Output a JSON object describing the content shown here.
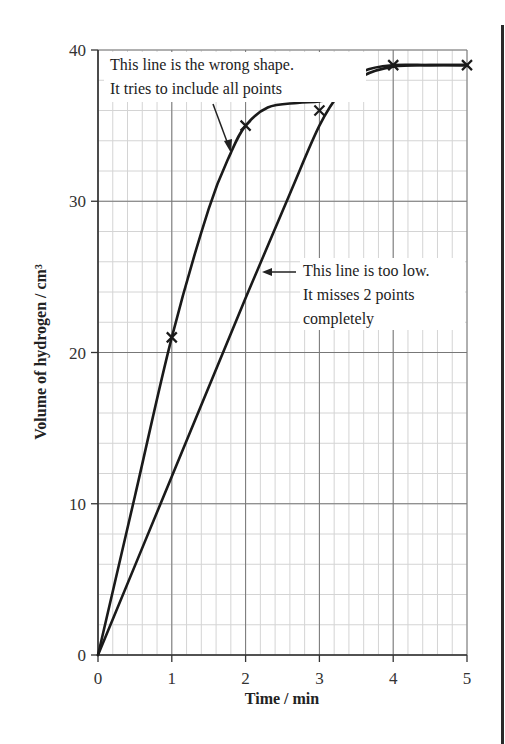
{
  "chart_data": {
    "type": "line",
    "title": "",
    "xlabel": "Time / min",
    "ylabel": "Volume of hydrogen / cm³",
    "xlim": [
      0,
      5
    ],
    "ylim": [
      0,
      40
    ],
    "x_ticks": [
      "0",
      "1",
      "2",
      "3",
      "4",
      "5"
    ],
    "y_ticks": [
      "0",
      "10",
      "20",
      "30",
      "40"
    ],
    "grid": {
      "on": true,
      "major_x": 1,
      "major_y": 10,
      "minor_x": 0.2,
      "minor_y": 2
    },
    "points": {
      "name": "measured points",
      "marker": "x",
      "x": [
        1,
        2,
        3,
        4,
        5
      ],
      "y": [
        21,
        35,
        36,
        39,
        39
      ]
    },
    "series": [
      {
        "name": "wrong-shape curve",
        "x": [
          0,
          0.5,
          1,
          1.5,
          1.8,
          2,
          2.3,
          2.7,
          3,
          3.3,
          3.6,
          4,
          4.5,
          5
        ],
        "y": [
          0,
          10.5,
          21,
          29.5,
          33.2,
          35,
          36.2,
          36.5,
          36.6,
          37.0,
          38.3,
          38.9,
          39,
          39
        ]
      },
      {
        "name": "too-low line",
        "x": [
          0,
          1,
          2,
          2.6,
          3,
          3.3,
          3.6,
          4,
          4.5,
          5
        ],
        "y": [
          0,
          11.8,
          23.6,
          30.5,
          35,
          37.3,
          38.6,
          39,
          39,
          39
        ]
      }
    ],
    "annotations": [
      {
        "lines": [
          "This line is the wrong shape.",
          "It tries to include all points"
        ],
        "arrow_target": [
          1.8,
          33.5
        ]
      },
      {
        "lines": [
          "This line is too low.",
          "It misses 2 points",
          "completely"
        ],
        "arrow_target": [
          2.25,
          25.5
        ]
      }
    ]
  }
}
